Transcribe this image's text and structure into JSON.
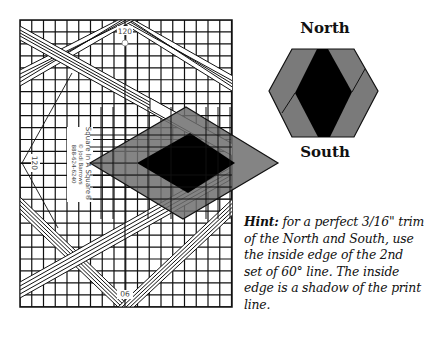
{
  "figure": {
    "ruler": {
      "product_name": "Square In A Square®",
      "copyright": "© Jodi Barrows",
      "phone": "888-624-6240",
      "angle_top": "120",
      "angle_left": "120",
      "angle_bottom": "90"
    },
    "hexagon": {
      "north_label": "North",
      "south_label": "South"
    },
    "hint": {
      "prefix": "Hint:",
      "text": " for a perfect 3/16\" trim of the North and South, use the inside edge of the 2nd set of 60° line. The inside edge is a shadow of the print line."
    },
    "colors": {
      "gray": "#7a7a7a",
      "black": "#000000",
      "grid": "#111111",
      "background": "#ffffff"
    }
  }
}
